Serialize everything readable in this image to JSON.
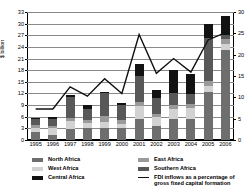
{
  "chart_data": {
    "type": "bar",
    "title": "",
    "subtitle": "",
    "xlabel": "",
    "ylabel": "$ billion",
    "ylabel_right": "per cent",
    "ylim": [
      0,
      33
    ],
    "ylim_right": [
      0,
      30
    ],
    "yticks": [
      0,
      3,
      6,
      9,
      12,
      15,
      18,
      21,
      24,
      27,
      30,
      33
    ],
    "yticks_right": [
      0,
      5,
      10,
      15,
      20,
      25,
      30
    ],
    "grid": true,
    "legend_position": "bottom",
    "categories": [
      "1995",
      "1996",
      "1997",
      "1998",
      "1999",
      "2000",
      "2001",
      "2002",
      "2003",
      "2004",
      "2005",
      "2006"
    ],
    "stacked": true,
    "series": [
      {
        "name": "North Africa",
        "color": "#6e6e6e",
        "values": [
          2.0,
          1.4,
          2.8,
          3.0,
          3.1,
          3.0,
          5.4,
          3.7,
          5.4,
          5.3,
          12.5,
          23.2
        ]
      },
      {
        "name": "West Africa",
        "color": "#d2d2d2",
        "values": [
          1.1,
          1.6,
          2.0,
          1.3,
          1.5,
          1.1,
          3.4,
          2.2,
          2.7,
          3.0,
          1.5,
          1.5
        ]
      },
      {
        "name": "East Africa",
        "color": "#9a9a9a",
        "values": [
          0.9,
          0.6,
          1.0,
          0.8,
          1.5,
          1.0,
          0.9,
          0.9,
          1.0,
          1.1,
          1.2,
          1.3
        ]
      },
      {
        "name": "Southern Africa",
        "color": "#585858",
        "values": [
          1.3,
          1.8,
          5.3,
          2.9,
          6.2,
          3.8,
          6.9,
          4.1,
          3.0,
          2.5,
          11.0,
          1.2
        ]
      },
      {
        "name": "Central Africa",
        "color": "#121212",
        "values": [
          0.4,
          0.5,
          0.4,
          1.0,
          0.2,
          0.6,
          3.0,
          2.1,
          6.0,
          5.2,
          3.8,
          4.8
        ]
      }
    ],
    "line_series": {
      "name": "FDI inflows as a percentage of gross fixed capital formation",
      "color": "#111111",
      "axis": "right",
      "values_left_scale": [
        8.0,
        8.0,
        13.7,
        11.3,
        15.8,
        12.0,
        27.2,
        17.2,
        21.0,
        17.5,
        25.8,
        27.7
      ]
    }
  },
  "legend": {
    "items": [
      {
        "label": "North Africa",
        "swatch": "#6e6e6e",
        "kind": "box"
      },
      {
        "label": "West Africa",
        "swatch": "#d2d2d2",
        "kind": "box"
      },
      {
        "label": "Central Africa",
        "swatch": "#121212",
        "kind": "box"
      },
      {
        "label": "East Africa",
        "swatch": "#9a9a9a",
        "kind": "box"
      },
      {
        "label": "Southern Africa",
        "swatch": "#585858",
        "kind": "box"
      },
      {
        "label": "FDI inflows as a percentage of",
        "label2": "gross fixed capital formation",
        "swatch": "#111111",
        "kind": "line"
      }
    ]
  }
}
